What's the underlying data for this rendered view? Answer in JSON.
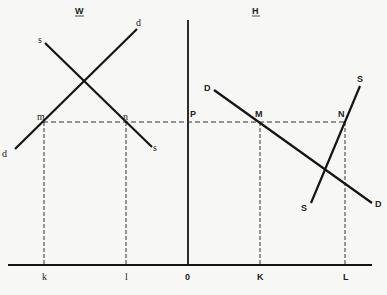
{
  "diagram": {
    "type": "supply-demand two-country trade diagram",
    "panels": {
      "left": {
        "title": "W",
        "supply_label": "s",
        "demand_label": "d"
      },
      "right": {
        "title": "H",
        "supply_label": "S",
        "demand_label": "D"
      }
    },
    "price_label": "P",
    "origin_label": "0",
    "left_points": {
      "m": "m",
      "n": "n"
    },
    "right_points": {
      "M": "M",
      "N": "N"
    },
    "axis_ticks": {
      "k": "k",
      "l": "l",
      "K": "K",
      "L": "L"
    },
    "colors": {
      "line": "#151515",
      "background": "#f7f7f5"
    }
  }
}
